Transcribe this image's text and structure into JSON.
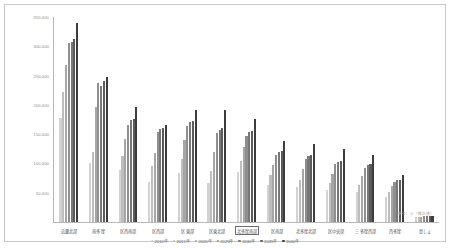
{
  "chart_data": {
    "type": "bar",
    "title": "",
    "xlabel": "",
    "ylabel": "",
    "ylim": [
      0,
      350000
    ],
    "grid": false,
    "legend_position": "bottom",
    "y_ticks": [
      "50,000",
      "100,000",
      "150,000",
      "200,000",
      "250,000",
      "300,000",
      "350,000"
    ],
    "y_tick_values": [
      50000,
      100000,
      150000,
      200000,
      250000,
      300000,
      350000
    ],
    "categories": [
      "近畿北部",
      "南多摩",
      "区西南部",
      "区西部",
      "区東部",
      "区東北部",
      "北多摩南部",
      "区南部",
      "北多摩北部",
      "区中央部",
      "三多摩西部",
      "西多摩",
      "島しょ"
    ],
    "selected_category": "北多摩南部",
    "series": [
      {
        "name": "2010年",
        "color": "#d2d2d2",
        "values": [
          178000,
          101000,
          88000,
          68000,
          83000,
          66000,
          86000,
          64000,
          59000,
          54000,
          52000,
          42000,
          8000
        ]
      },
      {
        "name": "2015年",
        "color": "#bdbdbd",
        "values": [
          222000,
          119000,
          112000,
          95000,
          108000,
          87000,
          104000,
          80000,
          72000,
          66000,
          64000,
          52000,
          9000
        ]
      },
      {
        "name": "2020年",
        "color": "#a6a6a6",
        "values": [
          268000,
          196000,
          142000,
          118000,
          140000,
          119000,
          128000,
          97000,
          90000,
          82000,
          79000,
          62000,
          9000
        ]
      },
      {
        "name": "2025年",
        "color": "#8f8f8f",
        "values": [
          305000,
          238000,
          166000,
          153000,
          164000,
          152000,
          147000,
          114000,
          108000,
          99000,
          93000,
          69000,
          10000
        ]
      },
      {
        "name": "2030年",
        "color": "#787878",
        "values": [
          308000,
          233000,
          174000,
          158000,
          170000,
          157000,
          153000,
          119000,
          112000,
          103000,
          97000,
          71000,
          10000
        ]
      },
      {
        "name": "2035年",
        "color": "#5c5c5c",
        "values": [
          312000,
          240000,
          176000,
          160000,
          172000,
          160000,
          156000,
          122000,
          114000,
          105000,
          99000,
          72000,
          10000
        ]
      },
      {
        "name": "2040年",
        "color": "#3d3d3d",
        "values": [
          340000,
          247000,
          197000,
          166000,
          191000,
          192000,
          176000,
          139000,
          134000,
          124000,
          114000,
          80000,
          11000
        ]
      }
    ],
    "annotation": "単位：人（推計値）"
  }
}
